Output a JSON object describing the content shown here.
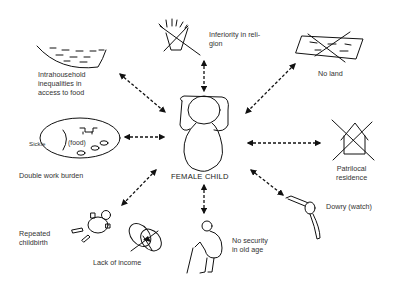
{
  "diagram": {
    "center": {
      "label": "FEMALE CHILD",
      "icon": "female-child-figure"
    },
    "nodes": [
      {
        "id": "food",
        "label": "Intrahousehold\ninequalities in\naccess to food",
        "icon": "empty-bowl-icon"
      },
      {
        "id": "religion",
        "label": "Inferiority in reli-\ngion",
        "icon": "crossed-out-shrine-icon"
      },
      {
        "id": "land",
        "label": "No land",
        "icon": "crossed-out-field-icon"
      },
      {
        "id": "work",
        "label": "Double work burden",
        "icon": "sickle-food-icon",
        "inner_labels": [
          "Sickle",
          "(food)"
        ]
      },
      {
        "id": "residence",
        "label": "Patrilocal\nresidence",
        "icon": "crossed-out-house-icon"
      },
      {
        "id": "dowry",
        "label": "Dowry (watch)",
        "icon": "watch-icon"
      },
      {
        "id": "childbirth",
        "label": "Repeated\nchildbirth",
        "icon": "baby-icon"
      },
      {
        "id": "income",
        "label": "Lack of income",
        "icon": "crossed-out-coin-icon"
      },
      {
        "id": "oldage",
        "label": "No security\nin old age",
        "icon": "elderly-person-icon"
      }
    ],
    "connector_style": "dashed-double-headed-arrow"
  }
}
